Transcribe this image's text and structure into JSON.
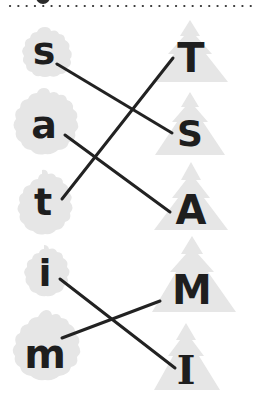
{
  "worksheet": {
    "type": "letter-matching",
    "header_divider": "dotted",
    "shape_fill": "#e6e6e6",
    "ink_color": "#1e1e1e",
    "line_color": "#222222",
    "lowercase": [
      {
        "letter": "s",
        "shape": "pinecone"
      },
      {
        "letter": "a",
        "shape": "pinecone"
      },
      {
        "letter": "t",
        "shape": "pinecone"
      },
      {
        "letter": "i",
        "shape": "pinecone"
      },
      {
        "letter": "m",
        "shape": "pinecone"
      }
    ],
    "uppercase": [
      {
        "letter": "T",
        "shape": "tree"
      },
      {
        "letter": "S",
        "shape": "tree"
      },
      {
        "letter": "A",
        "shape": "tree"
      },
      {
        "letter": "M",
        "shape": "tree"
      },
      {
        "letter": "I",
        "shape": "tree"
      }
    ],
    "matches": [
      {
        "from": "s",
        "to": "S"
      },
      {
        "from": "a",
        "to": "A"
      },
      {
        "from": "t",
        "to": "T"
      },
      {
        "from": "i",
        "to": "I"
      },
      {
        "from": "m",
        "to": "M"
      }
    ]
  }
}
